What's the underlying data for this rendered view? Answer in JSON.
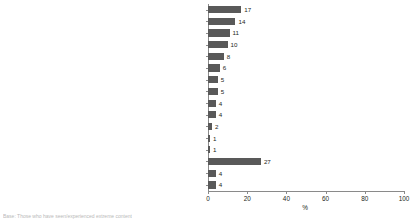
{
  "chart_data": {
    "type": "bar",
    "orientation": "horizontal",
    "title": "",
    "xlabel": "%",
    "ylabel": "",
    "xlim": [
      0,
      100
    ],
    "xticks": [
      0,
      20,
      40,
      60,
      80,
      100
    ],
    "grid": false,
    "legend": null,
    "bar_color": "#595959",
    "axis_color": "#8a8a8a",
    "categories": [
      "Religious extremism/ ISIS/Jihad/Terrorism/Beheading",
      "Racism",
      "Extreme hate",
      "Politics/Left or right wing extremism",
      "Homophobia",
      "Violence",
      "Sexism/Anti-feminists",
      "Death threats",
      "Erotic/Explicit material",
      "Social media/Facebook",
      "News media",
      "Nazis",
      "Bullying",
      "Other",
      "None/prefer not to say",
      "Don't know"
    ],
    "values": [
      17,
      14,
      11,
      10,
      8,
      6,
      5,
      5,
      4,
      4,
      2,
      1,
      1,
      27,
      4,
      4
    ],
    "data_labels": [
      "17",
      "14",
      "11",
      "10",
      "8",
      "6",
      "5",
      "5",
      "4",
      "4",
      "2",
      "1",
      "1",
      "27",
      "4",
      "4"
    ]
  },
  "footnote": {
    "text": "Base: Those who have seen/experienced extreme content"
  }
}
